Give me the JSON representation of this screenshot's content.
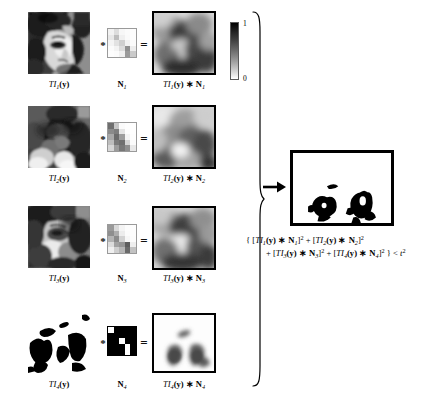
{
  "figure": {
    "type": "scientific-diagram",
    "rows": [
      {
        "source_label_prefix": "TI",
        "source_label_sub": "1",
        "source_label_suffix": "(y)",
        "kernel_label_prefix": "N",
        "kernel_label_sub": "1",
        "result_label": "TI",
        "result_sub": "1",
        "result_suffix": "(y) * N",
        "result_sub2": "1",
        "operator_convolve": "*",
        "operator_equals": "="
      },
      {
        "source_label_prefix": "TI",
        "source_label_sub": "2",
        "source_label_suffix": "(y)",
        "kernel_label_prefix": "N",
        "kernel_label_sub": "2",
        "result_label": "TI",
        "result_sub": "2",
        "result_suffix": "(y) * N",
        "result_sub2": "2",
        "operator_convolve": "*",
        "operator_equals": "="
      },
      {
        "source_label_prefix": "TI",
        "source_label_sub": "3",
        "source_label_suffix": "(y)",
        "kernel_label_prefix": "N",
        "kernel_label_sub": "3",
        "result_label": "TI",
        "result_sub": "3",
        "result_suffix": "(y) * N",
        "result_sub2": "3",
        "operator_convolve": "*",
        "operator_equals": "="
      },
      {
        "source_label_prefix": "TI",
        "source_label_sub": "4",
        "source_label_suffix": "(y)",
        "kernel_label_prefix": "N",
        "kernel_label_sub": "4",
        "result_label": "TI",
        "result_sub": "4",
        "result_suffix": "(y) * N",
        "result_sub2": "4",
        "operator_convolve": "*",
        "operator_equals": "="
      }
    ],
    "colorbar": {
      "max_label": "1",
      "min_label": "0",
      "top_color": "#000000",
      "bottom_color": "#ffffff"
    },
    "equation": {
      "line1_open": "{ [",
      "line1": "{ [TI1(y) * N1]2 + [TI2(y) * N2]2",
      "line2": "+ [TI3(y) * N3]2 + [TI4(y) * N4]2 } < t2",
      "tokens": {
        "brace_open": "{",
        "bracket_open": "[",
        "bracket_close": "]",
        "ti": "TI",
        "y": "(y)",
        "ast": "*",
        "n": "N",
        "square": "2",
        "plus": "+",
        "brace_close": "}",
        "less_than": "<",
        "threshold": "t",
        "sub1": "1",
        "sub2": "2",
        "sub3": "3",
        "sub4": "4"
      }
    },
    "arrow": {
      "direction": "right",
      "name": "implies-arrow"
    },
    "brace": {
      "orientation": "right-facing",
      "name": "grouping-brace"
    },
    "final_result": {
      "caption": "",
      "description": "binary segmentation mask"
    }
  }
}
